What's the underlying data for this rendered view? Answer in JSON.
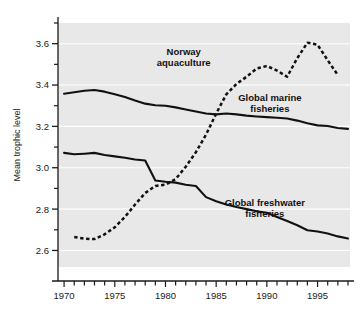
{
  "chart_data": {
    "type": "line",
    "title": "",
    "xlabel": "",
    "ylabel": "Mean trophic level",
    "xlim": [
      1969.4,
      1998.2
    ],
    "ylim": [
      2.52,
      3.7
    ],
    "grid": true,
    "grid_color": "#ffffff",
    "plot_background": "#e8e8e8",
    "legend_position": "inline-annotations",
    "x_ticks_major": [
      1970,
      1975,
      1980,
      1985,
      1990,
      1995
    ],
    "x_tick_labels": [
      "1970",
      "1975",
      "1980",
      "1985",
      "1990",
      "1995"
    ],
    "x_ticks_minor_step": 1,
    "x_minor_range": [
      1970,
      1998
    ],
    "y_ticks_major": [
      2.6,
      2.8,
      3.0,
      3.2,
      3.4,
      3.6
    ],
    "y_tick_labels": [
      "2.6",
      "2.8",
      "3.0",
      "3.2",
      "3.4",
      "3.6"
    ],
    "y_ticks_minor": [
      2.7,
      2.9,
      3.1,
      3.3,
      3.5,
      3.7
    ],
    "series": [
      {
        "name": "Norway aquaculture",
        "style": "dashed",
        "color": "#111111",
        "x": [
          1971,
          1972,
          1973,
          1974,
          1975,
          1976,
          1977,
          1978,
          1979,
          1980,
          1981,
          1982,
          1983,
          1984,
          1985,
          1986,
          1987,
          1988,
          1989,
          1990,
          1991,
          1992,
          1993,
          1994,
          1995,
          1996,
          1997
        ],
        "values": [
          2.665,
          2.657,
          2.655,
          2.678,
          2.712,
          2.762,
          2.822,
          2.878,
          2.912,
          2.918,
          2.945,
          3.005,
          3.075,
          3.16,
          3.262,
          3.355,
          3.405,
          3.44,
          3.48,
          3.492,
          3.47,
          3.44,
          3.53,
          3.605,
          3.595,
          3.52,
          3.448
        ]
      },
      {
        "name": "Global marine fisheries",
        "style": "solid",
        "color": "#111111",
        "x": [
          1970,
          1971,
          1972,
          1973,
          1974,
          1975,
          1976,
          1977,
          1978,
          1979,
          1980,
          1981,
          1982,
          1983,
          1984,
          1985,
          1986,
          1987,
          1988,
          1989,
          1990,
          1991,
          1992,
          1993,
          1994,
          1995,
          1996,
          1997,
          1998
        ],
        "values": [
          3.358,
          3.365,
          3.372,
          3.376,
          3.368,
          3.355,
          3.342,
          3.325,
          3.31,
          3.302,
          3.3,
          3.292,
          3.282,
          3.272,
          3.262,
          3.258,
          3.262,
          3.258,
          3.252,
          3.248,
          3.245,
          3.242,
          3.238,
          3.228,
          3.215,
          3.205,
          3.202,
          3.192,
          3.188
        ]
      },
      {
        "name": "Global freshwater fisheries",
        "style": "solid",
        "color": "#111111",
        "x": [
          1970,
          1971,
          1972,
          1973,
          1974,
          1975,
          1976,
          1977,
          1978,
          1979,
          1980,
          1981,
          1982,
          1983,
          1984,
          1985,
          1986,
          1987,
          1988,
          1989,
          1990,
          1991,
          1992,
          1993,
          1994,
          1995,
          1996,
          1997,
          1998
        ],
        "values": [
          3.072,
          3.065,
          3.068,
          3.072,
          3.062,
          3.055,
          3.048,
          3.04,
          3.035,
          2.938,
          2.932,
          2.928,
          2.918,
          2.912,
          2.858,
          2.838,
          2.822,
          2.81,
          2.8,
          2.79,
          2.782,
          2.762,
          2.742,
          2.722,
          2.698,
          2.692,
          2.682,
          2.668,
          2.658
        ]
      }
    ],
    "annotations": [
      {
        "id": "norway-label",
        "line1": "Norway",
        "line2": "aquaculture",
        "x": 1981.8,
        "y": 3.545
      },
      {
        "id": "marine-label",
        "line1": "Global marine",
        "line2": "fisheries",
        "x": 1990.3,
        "y": 3.325
      },
      {
        "id": "freshwater-label",
        "line1": "Global freshwater",
        "line2": "fisheries",
        "x": 1989.8,
        "y": 2.815
      }
    ]
  }
}
